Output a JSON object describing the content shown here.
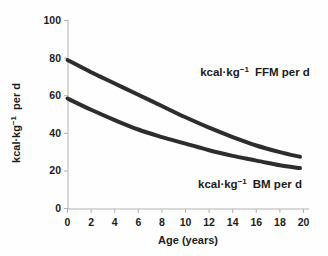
{
  "chart_data": {
    "type": "line",
    "title": "",
    "xlabel": "Age (years)",
    "ylabel": "kcal·kg−1 per d",
    "ylabel_parts": {
      "base": "kcal·kg",
      "sup": "−1",
      "rest": "per d"
    },
    "xlim": [
      0,
      20
    ],
    "ylim": [
      0,
      100
    ],
    "grid": false,
    "legend_position": "inline-annotations",
    "x_tick_labels": [
      "0",
      "2",
      "4",
      "6",
      "8",
      "10",
      "12",
      "14",
      "16",
      "18",
      "20"
    ],
    "y_tick_labels": [
      "0",
      "20",
      "40",
      "60",
      "80",
      "100"
    ],
    "x": [
      0,
      2,
      4,
      6,
      8,
      10,
      12,
      14,
      16,
      18,
      19.7
    ],
    "series": [
      {
        "name": "kcal·kg−1 FFM per d",
        "label_parts": {
          "base": "kcal·kg",
          "sup": "−1",
          "rest": "FFM per d"
        },
        "values": [
          79,
          72.5,
          66.5,
          60.5,
          54.5,
          48.5,
          43,
          38,
          33.5,
          30,
          27.5
        ]
      },
      {
        "name": "kcal·kg−1 BM per d",
        "label_parts": {
          "base": "kcal·kg",
          "sup": "−1",
          "rest": "BM per d"
        },
        "values": [
          58.5,
          52.5,
          47,
          42,
          38,
          34.5,
          31,
          28,
          25.5,
          23,
          21.5
        ]
      }
    ],
    "colors": {
      "line": "#2d2d2d",
      "axis": "#b2b2b2",
      "text": "#1c1c1c",
      "background": "#fefefe"
    }
  }
}
